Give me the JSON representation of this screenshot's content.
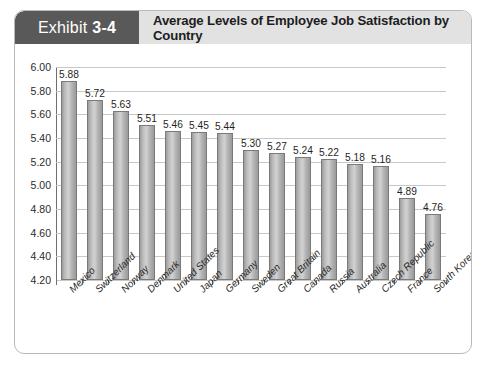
{
  "header": {
    "exhibit_word": "Exhibit",
    "exhibit_number": "3-4",
    "title": "Average Levels of Employee Job Satisfaction by Country",
    "tag_color": "#595959",
    "bar_color": "#e2e2e2"
  },
  "chart_data": {
    "type": "bar",
    "title": "Average Levels of Employee Job Satisfaction by Country",
    "xlabel": "",
    "ylabel": "",
    "ylim": [
      4.2,
      6.0
    ],
    "ytick_step": 0.2,
    "grid": true,
    "legend": "none",
    "bar_fill": "#b4b4b4",
    "bar_stroke": "#7a7a7a",
    "gridline_color": "#c8c8c8",
    "yticks": [
      "6.00",
      "5.80",
      "5.60",
      "5.40",
      "5.20",
      "5.00",
      "4.80",
      "4.60",
      "4.40",
      "4.20"
    ],
    "categories": [
      "Mexico",
      "Switzerland",
      "Norway",
      "Denmark",
      "United States",
      "Japan",
      "Germany",
      "Sweden",
      "Great Britain",
      "Canada",
      "Russia",
      "Australia",
      "Czech Republic",
      "France",
      "South Korea"
    ],
    "values": [
      5.88,
      5.72,
      5.63,
      5.51,
      5.46,
      5.45,
      5.44,
      5.3,
      5.27,
      5.24,
      5.22,
      5.18,
      5.16,
      4.89,
      4.76
    ],
    "value_labels": [
      "5.88",
      "5.72",
      "5.63",
      "5.51",
      "5.46",
      "5.45",
      "5.44",
      "5.30",
      "5.27",
      "5.24",
      "5.22",
      "5.18",
      "5.16",
      "4.89",
      "4.76"
    ]
  }
}
